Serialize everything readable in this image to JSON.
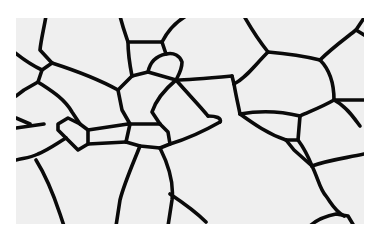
{
  "figure": {
    "background_color": "#ffffff",
    "panel_color": "#efefef",
    "line_color": "#0a0a0a"
  }
}
